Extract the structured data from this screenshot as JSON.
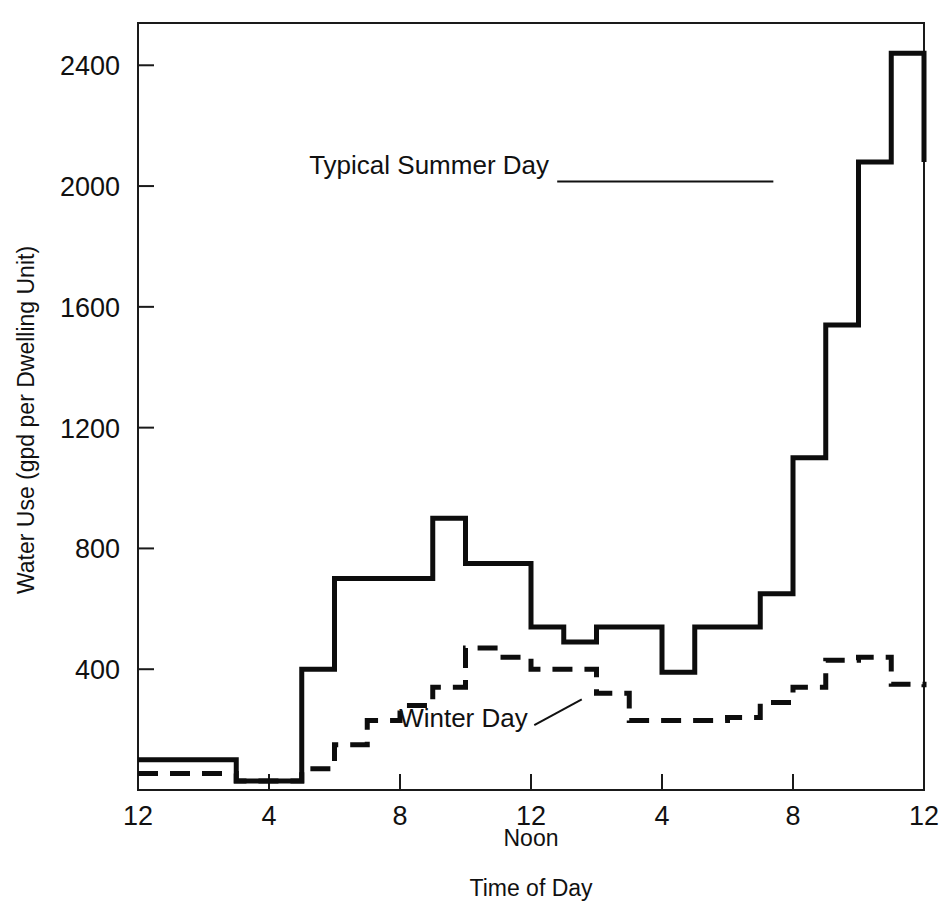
{
  "chart_data": {
    "type": "line",
    "subtype": "step",
    "title": "",
    "xlabel": "Time of Day",
    "ylabel": "Water Use (gpd per Dwelling Unit)",
    "noon_label": "Noon",
    "grid": false,
    "legend_position": "inline-annotations",
    "xlim": [
      0,
      24
    ],
    "ylim": [
      0,
      2540
    ],
    "x_tick_values": [
      0,
      4,
      8,
      12,
      16,
      20,
      24
    ],
    "x_tick_labels": [
      "12",
      "4",
      "8",
      "12",
      "4",
      "8",
      "12"
    ],
    "y_tick_values": [
      400,
      800,
      1200,
      1600,
      2000,
      2400
    ],
    "y_tick_labels": [
      "400",
      "800",
      "1200",
      "1600",
      "2000",
      "2400"
    ],
    "x": [
      0,
      1,
      2,
      3,
      4,
      5,
      6,
      7,
      8,
      9,
      10,
      11,
      12,
      13,
      14,
      15,
      16,
      17,
      18,
      19,
      20,
      21,
      22,
      23,
      24
    ],
    "series": [
      {
        "name": "Typical Summer Day",
        "style": "solid",
        "values": [
          100,
          100,
          100,
          30,
          30,
          400,
          700,
          700,
          700,
          900,
          750,
          750,
          540,
          490,
          540,
          540,
          390,
          540,
          540,
          650,
          1100,
          1540,
          2080,
          2440,
          2080
        ]
      },
      {
        "name": "Winter Day",
        "style": "dashed",
        "values": [
          55,
          55,
          55,
          30,
          30,
          70,
          150,
          230,
          280,
          340,
          470,
          440,
          400,
          400,
          320,
          230,
          230,
          230,
          240,
          290,
          340,
          430,
          440,
          350,
          340
        ]
      }
    ],
    "annotations": [
      {
        "label": "Typical Summer Day",
        "text_x": 12.55,
        "text_y": 2040,
        "anchor": "end",
        "leader_from_x": 12.8,
        "leader_from_y": 2015,
        "leader_to_x": 19.4,
        "leader_to_y": 2015
      },
      {
        "label": "Winter Day",
        "text_x": 11.9,
        "text_y": 210,
        "anchor": "end",
        "leader_from_x": 12.1,
        "leader_from_y": 215,
        "leader_to_x": 13.55,
        "leader_to_y": 300
      }
    ]
  },
  "plot_geometry": {
    "left": 138,
    "right": 924,
    "top": 23,
    "baseline": 790
  },
  "colors": {
    "ink": "#111111",
    "background": "#ffffff"
  }
}
